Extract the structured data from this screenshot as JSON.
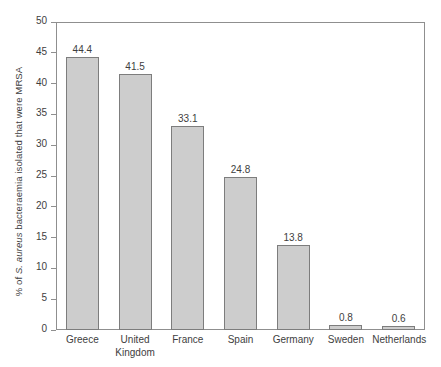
{
  "chart_data": {
    "type": "bar",
    "title": "",
    "xlabel": "",
    "ylabel_prefix": "% of ",
    "ylabel_italic": "S. aureus",
    "ylabel_suffix": " bacteraemia isolated that were MRSA",
    "ylabel_full": "% of S. aureus bacteraemia isolated that were MRSA",
    "categories": [
      "Greece",
      "United Kingdom",
      "France",
      "Spain",
      "Germany",
      "Sweden",
      "Netherlands"
    ],
    "category_lines": [
      [
        "Greece"
      ],
      [
        "United",
        "Kingdom"
      ],
      [
        "France"
      ],
      [
        "Spain"
      ],
      [
        "Germany"
      ],
      [
        "Sweden"
      ],
      [
        "Netherlands"
      ]
    ],
    "values": [
      44.4,
      41.5,
      33.1,
      24.8,
      13.8,
      0.8,
      0.6
    ],
    "value_labels": [
      "44.4",
      "41.5",
      "33.1",
      "24.8",
      "13.8",
      "0.8",
      "0.6"
    ],
    "ylim": [
      0,
      50
    ],
    "ytick_values": [
      0,
      5,
      10,
      15,
      20,
      25,
      30,
      35,
      40,
      45,
      50
    ],
    "ytick_labels": [
      "0",
      "5",
      "10",
      "15",
      "20",
      "25",
      "30",
      "35",
      "40",
      "45",
      "50"
    ],
    "grid": false,
    "legend": null,
    "bar_color": "#cdcdcd",
    "bar_border_color": "#7d7d7d",
    "axis_color": "#8f8f8f",
    "text_color": "#3e3e3e",
    "background": "#ffffff"
  }
}
